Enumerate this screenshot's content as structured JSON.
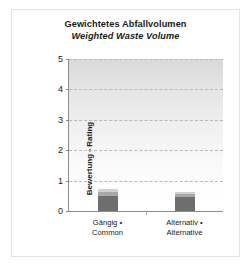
{
  "chart_data": {
    "type": "bar",
    "stacked": true,
    "title": "Gewichtetes Abfallvolumen",
    "subtitle": "Weighted Waste Volume",
    "xlabel": "",
    "ylabel": "Bewertung • Rating",
    "ylim": [
      0,
      5
    ],
    "yticks": [
      0,
      1,
      2,
      3,
      4,
      5
    ],
    "ytick_labels": [
      "0",
      "1",
      "2",
      "3",
      "4",
      "5"
    ],
    "grid": true,
    "legend": "none",
    "categories": [
      "Gängig • Common",
      "Alternativ • Alternative"
    ],
    "category_lines": [
      [
        "Gängig •",
        "Common"
      ],
      [
        "Alternativ •",
        "Alternative"
      ]
    ],
    "series": [
      {
        "name": "segment-1",
        "color": "#6e6e6e",
        "values": [
          0.5,
          0.45
        ]
      },
      {
        "name": "segment-2",
        "color": "#a8a8a8",
        "values": [
          0.12,
          0.1
        ]
      },
      {
        "name": "segment-3",
        "color": "#d0d0d0",
        "values": [
          0.09,
          0.06
        ]
      }
    ],
    "totals": [
      0.71,
      0.61
    ]
  },
  "title": {
    "de": "Gewichtetes Abfallvolumen",
    "en": "Weighted Waste Volume"
  },
  "axes": {
    "y_title": "Bewertung • Rating",
    "y_ticks": [
      "5",
      "4",
      "3",
      "2",
      "1",
      "0"
    ]
  },
  "categories": [
    {
      "line1": "Gängig •",
      "line2": "Common"
    },
    {
      "line1": "Alternativ •",
      "line2": "Alternative"
    }
  ],
  "colors": {
    "segment_dark": "#6e6e6e",
    "segment_mid": "#a8a8a8",
    "segment_light": "#d0d0d0",
    "axis": "#8c8c8c",
    "grid": "#b9b9b9",
    "frame": "#e3e3e3",
    "text": "#1b1b1b"
  }
}
